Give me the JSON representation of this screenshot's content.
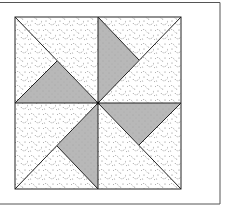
{
  "figure": {
    "colors": {
      "background": "#ffffff",
      "frame_line": "#555555",
      "outline": "#222222",
      "light_fabric_base": "#ffffff",
      "light_fabric_dots": "#6a6a6a",
      "dark_fabric": "#b8b8b8"
    },
    "block": {
      "x": 15,
      "y": 17,
      "size": 166,
      "center": [
        98,
        103
      ]
    },
    "dark_triangles": [
      {
        "name": "triangle-left",
        "points": "15,103 98,103 57,61"
      },
      {
        "name": "triangle-top",
        "points": "98,17 98,103 139,60"
      },
      {
        "name": "triangle-right",
        "points": "98,103 181,103 139,145"
      },
      {
        "name": "triangle-bottom",
        "points": "98,103 98,189 57,146"
      }
    ]
  }
}
